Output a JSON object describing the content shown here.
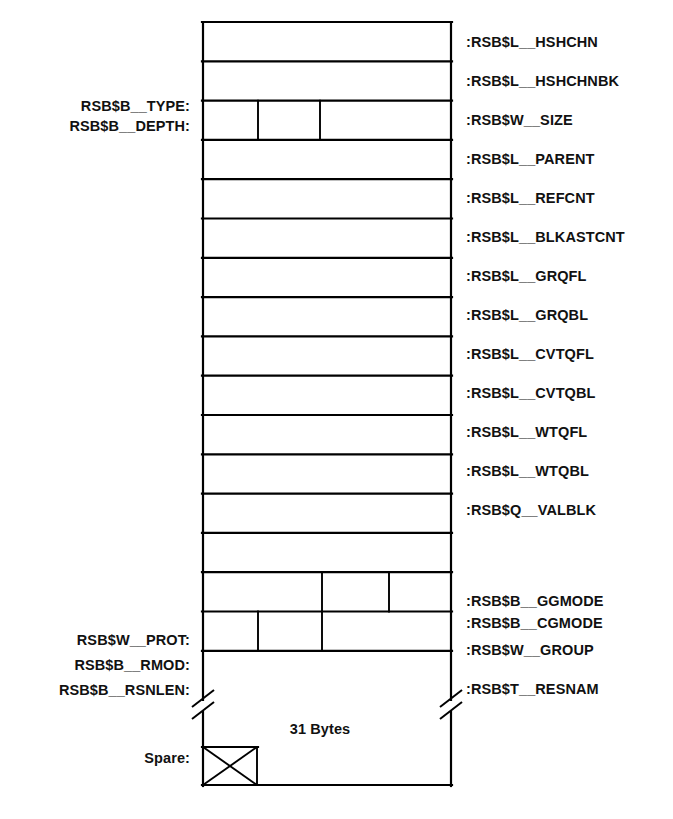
{
  "diagram": {
    "geometry": {
      "box_left": 202,
      "box_right": 452,
      "top": 22,
      "row_height": 39.3,
      "stroke_color": "#000000"
    },
    "right_labels": [
      {
        "text": ":RSB$L__HSHCHN",
        "y": 47
      },
      {
        "text": ":RSB$L__HSHCHNBK",
        "y": 86
      },
      {
        "text": ":RSB$W__SIZE",
        "y": 125
      },
      {
        "text": ":RSB$L__PARENT",
        "y": 164
      },
      {
        "text": ":RSB$L__REFCNT",
        "y": 203
      },
      {
        "text": ":RSB$L__BLKASTCNT",
        "y": 242
      },
      {
        "text": ":RSB$L__GRQFL",
        "y": 281
      },
      {
        "text": ":RSB$L__GRQBL",
        "y": 320
      },
      {
        "text": ":RSB$L__CVTQFL",
        "y": 359
      },
      {
        "text": ":RSB$L__CVTQBL",
        "y": 398
      },
      {
        "text": ":RSB$L__WTQFL",
        "y": 437
      },
      {
        "text": ":RSB$L__WTQBL",
        "y": 476
      },
      {
        "text": ":RSB$Q__VALBLK",
        "y": 515
      },
      {
        "text": ":RSB$B__GGMODE",
        "y": 606
      },
      {
        "text": ":RSB$B__CGMODE",
        "y": 628
      },
      {
        "text": ":RSB$W__GROUP",
        "y": 655
      },
      {
        "text": ":RSB$T__RESNAM",
        "y": 694
      }
    ],
    "left_labels": [
      {
        "text": "RSB$B__TYPE:",
        "y": 111
      },
      {
        "text": "RSB$B__DEPTH:",
        "y": 131
      },
      {
        "text": "RSB$W__PROT:",
        "y": 645
      },
      {
        "text": "RSB$B__RMOD:",
        "y": 670
      },
      {
        "text": "RSB$B__RSNLEN:",
        "y": 695
      },
      {
        "text": "Spare:",
        "y": 763
      }
    ],
    "inner_labels": [
      {
        "text": "31 Bytes",
        "x": 320,
        "y": 734
      }
    ],
    "row_dividers": {
      "size_row": [
        258,
        320
      ],
      "ggmode_row": [
        322,
        389
      ],
      "group_row": [
        258,
        322
      ]
    }
  }
}
